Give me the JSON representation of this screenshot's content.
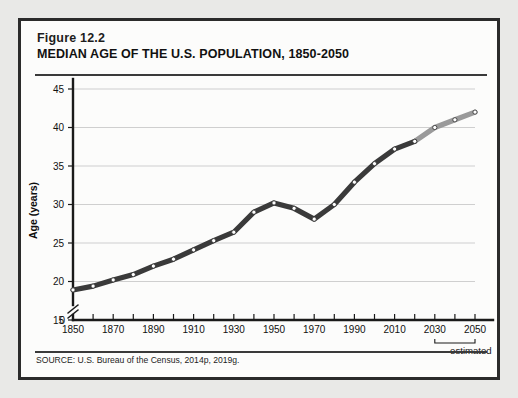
{
  "figure": {
    "number": "Figure 12.2",
    "title": "MEDIAN AGE OF THE U.S. POPULATION, 1850-2050",
    "source": "SOURCE: U.S. Bureau of the Census, 2014p,  2019g.",
    "estimated_label": "estimated",
    "estimated_from_year": 2030,
    "estimated_to_year": 2050
  },
  "colors": {
    "page_background": "#e9e9e7",
    "card_background": "#fcfcfb",
    "card_border": "#2b2b2b",
    "rule": "#3a3a3a",
    "gridline": "#c9c9c9",
    "axis": "#1a1a1a",
    "series_actual": "#3a3a3a",
    "series_projected": "#9a9a9a",
    "marker_fill": "#ffffff"
  },
  "chart_data": {
    "type": "line",
    "title": "MEDIAN AGE OF THE U.S. POPULATION, 1850-2050",
    "xlabel": "",
    "ylabel": "Age (years)",
    "xlim": [
      1850,
      2050
    ],
    "ylim": [
      15,
      45
    ],
    "y_zero_tick": 0,
    "axis_break": true,
    "grid": true,
    "legend": false,
    "xticks": [
      1850,
      1870,
      1890,
      1910,
      1930,
      1950,
      1970,
      1990,
      2010,
      2030,
      2050
    ],
    "xtick_labels": [
      "1850",
      "1870",
      "1890",
      "1910",
      "1930",
      "1950",
      "1970",
      "1990",
      "2010",
      "2030",
      "2050"
    ],
    "xticks_minor": [
      1860,
      1880,
      1900,
      1920,
      1940,
      1960,
      1980,
      2000,
      2020,
      2040
    ],
    "yticks": [
      0,
      15,
      20,
      25,
      30,
      35,
      40,
      45
    ],
    "ytick_labels": [
      "0",
      "15",
      "20",
      "25",
      "30",
      "35",
      "40",
      "45"
    ],
    "x": [
      1850,
      1860,
      1870,
      1880,
      1890,
      1900,
      1910,
      1920,
      1930,
      1940,
      1950,
      1960,
      1970,
      1980,
      1990,
      2000,
      2010,
      2020,
      2030,
      2040,
      2050
    ],
    "values": [
      18.9,
      19.4,
      20.2,
      20.9,
      22.0,
      22.9,
      24.1,
      25.3,
      26.4,
      29.0,
      30.2,
      29.5,
      28.1,
      30.0,
      32.9,
      35.3,
      37.2,
      38.2,
      40.0,
      41.0,
      42.0
    ],
    "series": [
      {
        "name": "Median age (observed)",
        "x": [
          1850,
          1860,
          1870,
          1880,
          1890,
          1900,
          1910,
          1920,
          1930,
          1940,
          1950,
          1960,
          1970,
          1980,
          1990,
          2000,
          2010,
          2020
        ],
        "values": [
          18.9,
          19.4,
          20.2,
          20.9,
          22.0,
          22.9,
          24.1,
          25.3,
          26.4,
          29.0,
          30.2,
          29.5,
          28.1,
          30.0,
          32.9,
          35.3,
          37.2,
          38.2
        ],
        "color": "#3a3a3a"
      },
      {
        "name": "Median age (projected)",
        "x": [
          2020,
          2030,
          2040,
          2050
        ],
        "values": [
          38.2,
          40.0,
          41.0,
          42.0
        ],
        "color": "#9a9a9a"
      }
    ]
  }
}
